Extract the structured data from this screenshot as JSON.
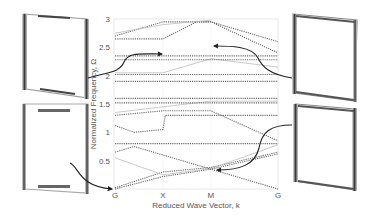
{
  "chart_data": {
    "type": "line",
    "title": "",
    "xlabel": "Reduced Wave Vector, k",
    "ylabel": "Normalized Frequency, Ω",
    "x_ticks": [
      "G",
      "X",
      "M",
      "G"
    ],
    "x_tick_positions": [
      0,
      1,
      2,
      3.4
    ],
    "y_ticks": [
      "0.5",
      "1",
      "1.5",
      "2",
      "2.5",
      "3"
    ],
    "y_tick_values": [
      0.5,
      1,
      1.5,
      2,
      2.5,
      3
    ],
    "ylim": [
      0,
      3
    ],
    "xlim": [
      0,
      3.4
    ],
    "grid": false,
    "legend": null,
    "line_style": "dotted/dashed dispersion bands",
    "colors": {
      "bands": "#6b6b6b",
      "light_bands": "#bdbdbd",
      "arrows": "#222222",
      "axis": "#cfcfcf"
    },
    "series": [
      {
        "name": "band-1",
        "x": [
          0,
          1,
          2,
          3.4
        ],
        "values": [
          0.0,
          0.22,
          0.35,
          0.0
        ]
      },
      {
        "name": "band-2",
        "x": [
          0,
          1,
          2,
          3.4
        ],
        "values": [
          0.02,
          0.3,
          0.38,
          0.65
        ]
      },
      {
        "name": "band-3",
        "x": [
          0,
          1,
          2,
          3.4
        ],
        "values": [
          0.55,
          0.25,
          0.36,
          0.78
        ]
      },
      {
        "name": "band-4",
        "x": [
          0,
          0.4,
          1,
          2,
          3.4
        ],
        "values": [
          0.65,
          0.75,
          0.6,
          0.35,
          0.62
        ]
      },
      {
        "name": "band-5",
        "x": [
          0,
          1,
          3.4
        ],
        "values": [
          0.8,
          0.8,
          0.8
        ]
      },
      {
        "name": "band-6",
        "x": [
          0,
          0.4,
          1,
          1.05,
          3.4
        ],
        "values": [
          1.12,
          1.0,
          1.05,
          1.3,
          1.3
        ]
      },
      {
        "name": "band-7",
        "x": [
          0,
          1,
          2,
          3.4
        ],
        "values": [
          1.3,
          1.38,
          1.38,
          0.85
        ]
      },
      {
        "name": "band-8",
        "x": [
          0,
          1,
          2,
          3.4
        ],
        "values": [
          1.35,
          1.45,
          1.55,
          1.55
        ]
      },
      {
        "name": "band-9",
        "x": [
          0,
          3.4
        ],
        "values": [
          1.52,
          1.52
        ]
      },
      {
        "name": "band-10",
        "x": [
          0,
          3.4
        ],
        "values": [
          1.6,
          1.6
        ]
      },
      {
        "name": "band-11",
        "x": [
          0,
          3.4
        ],
        "values": [
          1.9,
          1.9
        ]
      },
      {
        "name": "band-12",
        "x": [
          0,
          3.4
        ],
        "values": [
          2.02,
          2.02
        ]
      },
      {
        "name": "band-13",
        "x": [
          0,
          1,
          2,
          3.4
        ],
        "values": [
          2.05,
          2.05,
          2.3,
          2.15
        ]
      },
      {
        "name": "band-14",
        "x": [
          0,
          3.4
        ],
        "values": [
          2.28,
          2.28
        ]
      },
      {
        "name": "band-15",
        "x": [
          0,
          3.4
        ],
        "values": [
          2.35,
          2.35
        ]
      },
      {
        "name": "band-16",
        "x": [
          0,
          1,
          1.7,
          2,
          3.4
        ],
        "values": [
          2.65,
          2.65,
          2.95,
          2.95,
          2.4
        ]
      },
      {
        "name": "band-17",
        "x": [
          0,
          1,
          2,
          3.4
        ],
        "values": [
          2.7,
          2.95,
          2.95,
          2.6
        ]
      },
      {
        "name": "band-18",
        "x": [
          0,
          1,
          2
        ],
        "values": [
          2.75,
          2.9,
          2.98
        ]
      }
    ],
    "annotations": [
      {
        "label": "mode-shape-top-left",
        "points_to": {
          "x_label": "X",
          "omega": 2.35
        }
      },
      {
        "label": "mode-shape-top-right",
        "points_to": {
          "x_label": "M",
          "omega": 2.5
        }
      },
      {
        "label": "mode-shape-bottom-left",
        "points_to": {
          "x_label": "G",
          "omega": 0.0
        }
      },
      {
        "label": "mode-shape-bottom-right",
        "points_to": {
          "x_label": "M",
          "omega": 0.35
        }
      }
    ]
  },
  "labels": {
    "xlabel": "Reduced Wave Vector, k",
    "ylabel": "Normalized Frequency, Ω",
    "x_ticks": [
      "G",
      "X",
      "M",
      "G"
    ],
    "y_ticks": [
      "3",
      "2.5",
      "2",
      "1.5",
      "1",
      "0.5"
    ]
  }
}
